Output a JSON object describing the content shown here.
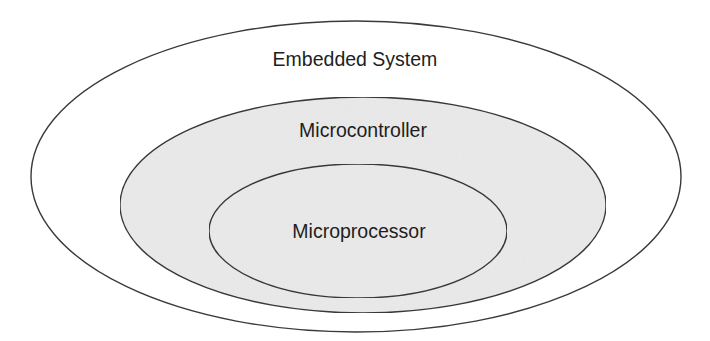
{
  "diagram": {
    "type": "nested-ellipses (Venn/containment)",
    "colors": {
      "stroke": "#3a3a3a",
      "outer_fill": "#ffffff",
      "inner_fill": "#ebebeb",
      "text": "#1e1e1e"
    },
    "sets": [
      {
        "id": "embedded-system",
        "label": "Embedded System",
        "contains": [
          "microcontroller"
        ]
      },
      {
        "id": "microcontroller",
        "label": "Microcontroller",
        "contains": [
          "microprocessor"
        ]
      },
      {
        "id": "microprocessor",
        "label": "Microprocessor",
        "contains": []
      }
    ]
  }
}
